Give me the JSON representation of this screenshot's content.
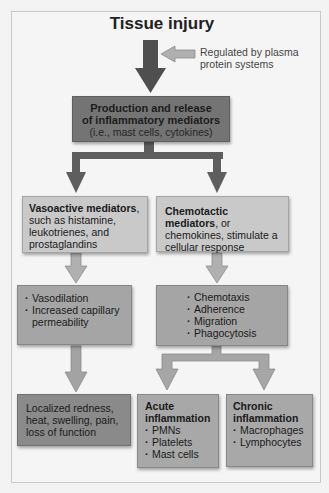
{
  "title": "Tissue injury",
  "note": {
    "line1": "Regulated by plasma",
    "line2": "protein systems"
  },
  "production": {
    "line1": "Production and release",
    "line2": "of inflammatory mediators",
    "line3": "(i.e., mast cells, cytokines)"
  },
  "vasoactive": {
    "bold": "Vasoactive mediators",
    "rest": ", such as histamine, leukotrienes, and prostaglandins"
  },
  "chemotactic": {
    "bold": "Chemotactic mediators",
    "rest": ", or chemokines, stimulate a cellular response"
  },
  "vascular_effects": {
    "items": [
      "Vasodilation",
      "Increased capillary permeability"
    ]
  },
  "cellular_effects": {
    "items": [
      "Chemotaxis",
      "Adherence",
      "Migration",
      "Phagocytosis"
    ]
  },
  "localized": {
    "text": "Localized redness, heat, swelling, pain, loss of function"
  },
  "acute": {
    "title": "Acute inflammation",
    "items": [
      "PMNs",
      "Platelets",
      "Mast cells"
    ]
  },
  "chronic": {
    "title": "Chronic inflammation",
    "items": [
      "Macrophages",
      "Lymphocytes"
    ]
  },
  "colors": {
    "dark_arrow": "#555555",
    "light_arrow": "#a9a9a9",
    "production_box": "#747474",
    "mediator_boxes": "#c9c9c9",
    "effect_boxes": "#a5a5a5",
    "outcome_box": "#8a8a8a"
  }
}
